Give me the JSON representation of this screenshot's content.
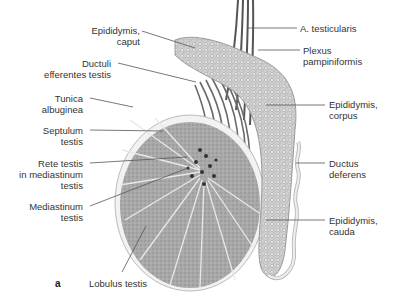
{
  "figure": {
    "panel_letter": "a",
    "colors": {
      "tissue": "#a9a9a9",
      "septa": "#e6e6e6",
      "outline": "#777777",
      "leader": "#555555",
      "text": "#333333"
    }
  },
  "labels_left": [
    {
      "id": "epididymis-caput",
      "text": "Epididymis,\ncaput"
    },
    {
      "id": "ductuli-efferentes",
      "text": "Ductuli\nefferentes testis"
    },
    {
      "id": "tunica-albuginea",
      "text": "Tunica\nalbuginea"
    },
    {
      "id": "septulum-testis",
      "text": "Septulum\ntestis"
    },
    {
      "id": "rete-testis",
      "text": "Rete testis\nin mediastinum\ntestis"
    },
    {
      "id": "mediastinum-testis",
      "text": "Mediastinum\ntestis"
    }
  ],
  "labels_right": [
    {
      "id": "a-testicularis",
      "text": "A. testicularis"
    },
    {
      "id": "plexus-pampiniformis",
      "text": "Plexus\npampiniformis"
    },
    {
      "id": "epididymis-corpus",
      "text": "Epididymis,\ncorpus"
    },
    {
      "id": "ductus-deferens",
      "text": "Ductus\ndeferens"
    },
    {
      "id": "epididymis-cauda",
      "text": "Epididymis,\ncauda"
    }
  ],
  "labels_bottom": [
    {
      "id": "lobulus-testis",
      "text": "Lobulus testis"
    }
  ]
}
